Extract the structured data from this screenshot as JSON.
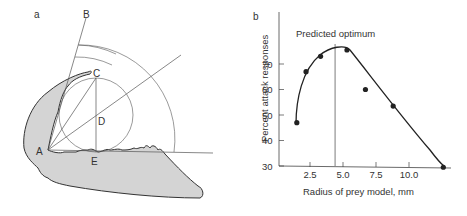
{
  "panel_a": {
    "label": "a",
    "points": {
      "A": "A",
      "B": "B",
      "C": "C",
      "D": "D",
      "E": "E"
    },
    "fill": "#d4d4d4",
    "stroke": "#333333"
  },
  "panel_b": {
    "label": "b",
    "annotation": "Predicted optimum"
  },
  "chart_data": {
    "type": "scatter",
    "title": "",
    "xlabel": "Radius of prey model, mm",
    "ylabel": "Percent attack responses",
    "x_ticks": [
      "2.5",
      "5.0",
      "7.5",
      "10.0"
    ],
    "y_ticks": [
      "30",
      "40",
      "50",
      "60",
      "70"
    ],
    "xlim": [
      0,
      13
    ],
    "ylim": [
      30,
      80
    ],
    "grid": false,
    "series": [
      {
        "name": "observed",
        "x": [
          1.5,
          2.2,
          3.3,
          5.3,
          6.7,
          8.8,
          12.6
        ],
        "y": [
          47,
          67,
          73,
          75.5,
          60,
          53.5,
          29.5
        ]
      }
    ],
    "fitted_curve": true,
    "annotations": [
      {
        "text": "Predicted optimum",
        "x": 4.4
      }
    ]
  }
}
